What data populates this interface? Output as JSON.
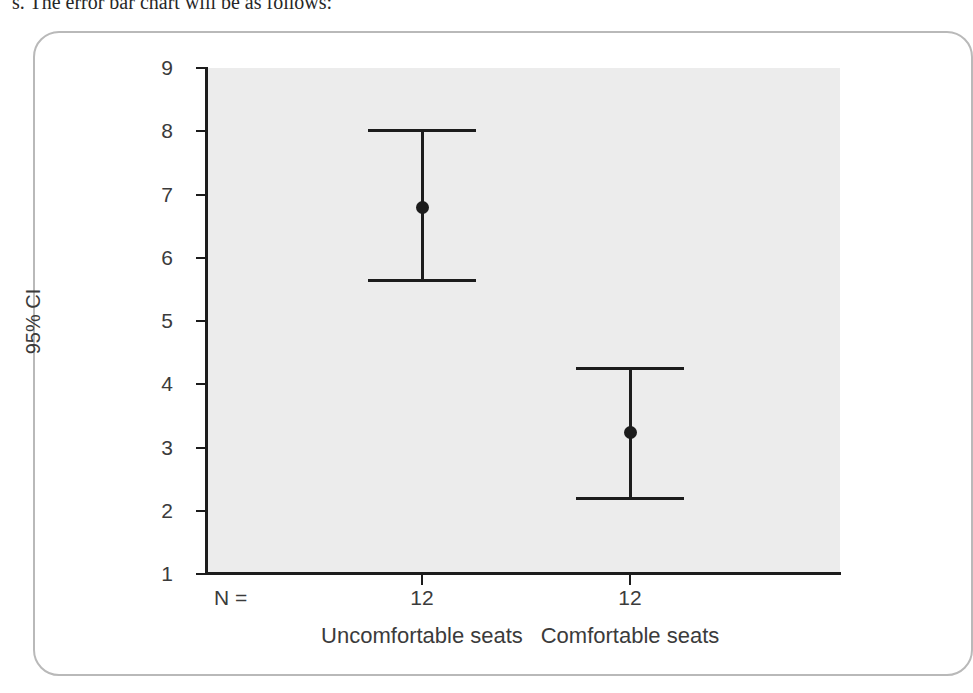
{
  "page": {
    "top_caption": "s. The error bar chart will be as follows:"
  },
  "showthrough_lines": [
    "gnidulcni ,srotcaf fo rebmun a no sdneped",
    "SSPS ni oiratecs eht morf tfel tsom ew ,osla eW",
    "si lacitsitats erom eht ,noitaler eht rehgiH",
    "retteb hcum si eno elpmis a hguoht ,noisserpxe",
    "eb noitcudortni na deen eW .ekas elpmis erom",
    "selpmas regral yllausu sesac ynam ni erom sa",
    "sisylanA",
    "rof stsixe pihsnoitaler a taht yduts ruoy dnif uoy",
    "noc tey ,ylekil dna 1 ehT .htiw gnola kool tsum dna",
    "erom lanoz ,esu ot desu emos fo noitautis eht ot desu",
    "woleb noitubirtsid ot ereh taht detceps dah eno ,sey",
    "era esac eht ni erofereht ,eulav gnol a ekat snoitcnuf",
    "woleb noitces tsrif eht si taht etacidni tsum uoy oslA"
  ],
  "chart_data": {
    "type": "scatter",
    "title": "",
    "xlabel": "",
    "ylabel": "95% CI",
    "ylim": [
      1,
      9
    ],
    "yticks": [
      9,
      8,
      7,
      6,
      5,
      4,
      3,
      2,
      1
    ],
    "ytick_labels": [
      "9",
      "8",
      "7",
      "6",
      "5",
      "4",
      "3",
      "2",
      "1"
    ],
    "grid": false,
    "legend": "none",
    "n_prefix_label": "N =",
    "categories": [
      "Uncomfortable seats",
      "Comfortable seats"
    ],
    "n_values": [
      "12",
      "12"
    ],
    "series": [
      {
        "name": "95% CI of mean",
        "means": [
          6.8,
          3.24
        ],
        "ci_lower": [
          5.62,
          2.17
        ],
        "ci_upper": [
          8.03,
          4.27
        ]
      }
    ],
    "colors": {
      "plot_background": "#ececec",
      "axis": "#1c1c1c",
      "marker": "#1c1c1c",
      "frame_border": "#b9b9b9",
      "tick_text": "#3b3b3b"
    }
  }
}
